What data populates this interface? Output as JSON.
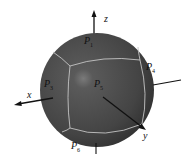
{
  "figure": {
    "axes": {
      "x": "x",
      "y": "y",
      "z": "z"
    },
    "faces": {
      "p1": {
        "base": "P",
        "sub": "1"
      },
      "p3": {
        "base": "P",
        "sub": "3"
      },
      "p4": {
        "base": "P",
        "sub": "4"
      },
      "p5": {
        "base": "P",
        "sub": "5"
      },
      "p6": {
        "base": "P",
        "sub": "6"
      }
    },
    "colors": {
      "sphere": "#4a4a4a",
      "seam": "#bdbdbd",
      "axis": "#111111"
    }
  }
}
